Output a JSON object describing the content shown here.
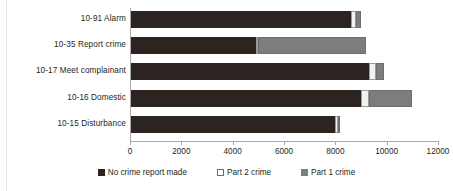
{
  "chart_data": {
    "type": "bar",
    "orientation": "horizontal",
    "stacked": true,
    "title": "",
    "xlabel": "",
    "ylabel": "",
    "xlim": [
      0,
      12000
    ],
    "xticks": [
      0,
      2000,
      4000,
      6000,
      8000,
      10000,
      12000
    ],
    "xtick_labels": [
      "0",
      "2000",
      "4000",
      "6000",
      "8000",
      "10000",
      "12000"
    ],
    "grid": false,
    "legend_position": "bottom",
    "categories": [
      "10-91 Alarm",
      "10-35 Report crime",
      "10-17 Meet complainant",
      "10-16 Domestic",
      "10-15 Disturbance"
    ],
    "series": [
      {
        "name": "No crime report made",
        "color": "#2b2420",
        "values": [
          8600,
          4900,
          9300,
          9000,
          8000
        ]
      },
      {
        "name": "Part 2 crime",
        "color": "#f2f2f2",
        "values": [
          200,
          100,
          300,
          300,
          100
        ]
      },
      {
        "name": "Part 1 crime",
        "color": "#7d7d80",
        "values": [
          200,
          4200,
          300,
          1700,
          100
        ]
      }
    ],
    "totals": [
      9000,
      9200,
      9900,
      11000,
      8200
    ]
  },
  "legend": {
    "items": [
      {
        "label": "No crime report made"
      },
      {
        "label": "Part 2 crime"
      },
      {
        "label": "Part 1 crime"
      }
    ]
  }
}
